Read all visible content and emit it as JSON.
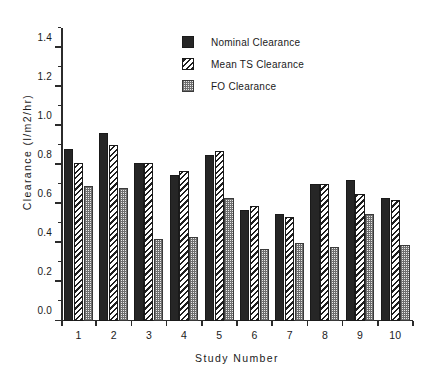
{
  "chart_data": {
    "type": "bar",
    "title": "",
    "xlabel": "Study  Number",
    "ylabel": "Clearance   (l/m2/hr)",
    "ylabel_name": "Clearance",
    "ylabel_unit": "(l/m2/hr)",
    "categories": [
      "1",
      "2",
      "3",
      "4",
      "5",
      "6",
      "7",
      "8",
      "9",
      "10"
    ],
    "ylim": [
      0.0,
      1.5
    ],
    "ytick_labels": [
      "0.0",
      "0.2",
      "0.4",
      "0.6",
      "0.8",
      "1.0",
      "1.2",
      "1.4"
    ],
    "ytick_values": [
      0.0,
      0.2,
      0.4,
      0.6,
      0.8,
      1.0,
      1.2,
      1.4
    ],
    "yminor_values": [
      0.1,
      0.3,
      0.5,
      0.7,
      0.9,
      1.1,
      1.3,
      1.5
    ],
    "grid": false,
    "legend_position": "top-center",
    "series": [
      {
        "name": "Nominal Clearance",
        "pattern": "solid-black",
        "color": "#262626",
        "values": [
          0.88,
          0.96,
          0.81,
          0.75,
          0.85,
          0.57,
          0.55,
          0.7,
          0.72,
          0.63
        ]
      },
      {
        "name": "Mean TS Clearance",
        "pattern": "diagonal-hatch",
        "color": "#1f1f1f",
        "values": [
          0.81,
          0.9,
          0.81,
          0.77,
          0.87,
          0.59,
          0.53,
          0.7,
          0.65,
          0.62
        ]
      },
      {
        "name": "FO Clearance",
        "pattern": "checkerboard",
        "color": "#b8b8b8",
        "values": [
          0.69,
          0.68,
          0.42,
          0.43,
          0.63,
          0.37,
          0.4,
          0.38,
          0.55,
          0.39
        ]
      }
    ]
  }
}
